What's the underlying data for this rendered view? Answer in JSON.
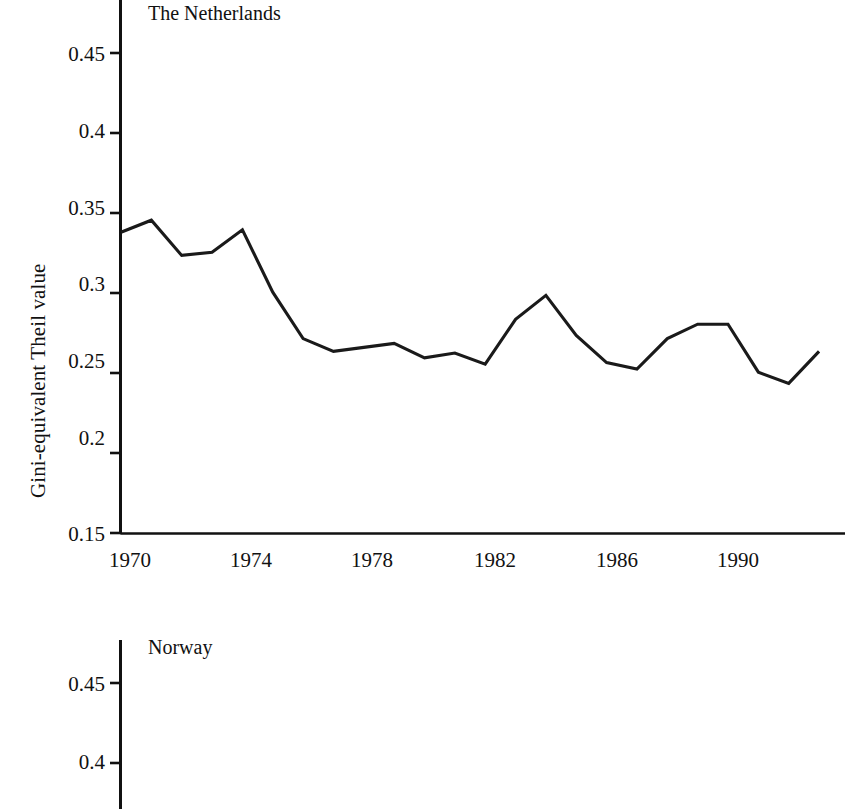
{
  "figure": {
    "ylabel": "Gini-equivalent Theil value"
  },
  "panels": [
    {
      "id": "netherlands",
      "title": "The Netherlands",
      "ylabel": "Gini-equivalent Theil value",
      "yticks": [
        "0.45",
        "0.4",
        "0.35",
        "0.3",
        "0.25",
        "0.2",
        "0.15"
      ],
      "xticks": [
        "1970",
        "1974",
        "1978",
        "1982",
        "1986",
        "1990"
      ]
    },
    {
      "id": "norway",
      "title": "Norway",
      "ylabel_partial": "ue",
      "yticks": [
        "0.45",
        "0.4"
      ],
      "xticks": []
    }
  ],
  "chart_data": [
    {
      "type": "line",
      "title": "The Netherlands",
      "xlabel": "",
      "ylabel": "Gini-equivalent Theil value",
      "xlim": [
        1970,
        1993.2
      ],
      "ylim": [
        0.15,
        0.47
      ],
      "xticks": [
        1970,
        1974,
        1978,
        1982,
        1986,
        1990
      ],
      "yticks": [
        0.15,
        0.2,
        0.25,
        0.3,
        0.35,
        0.4,
        0.45
      ],
      "grid": false,
      "legend": "none",
      "x": [
        1970,
        1971,
        1972,
        1973,
        1974,
        1975,
        1976,
        1977,
        1978,
        1979,
        1980,
        1981,
        1982,
        1983,
        1984,
        1985,
        1986,
        1987,
        1988,
        1989,
        1990,
        1991,
        1992,
        1993
      ],
      "series": [
        {
          "name": "The Netherlands",
          "values": [
            0.338,
            0.3455,
            0.3235,
            0.3255,
            0.3395,
            0.3005,
            0.2715,
            0.2635,
            0.266,
            0.2685,
            0.2595,
            0.2625,
            0.2555,
            0.2835,
            0.2985,
            0.2735,
            0.2565,
            0.2525,
            0.2715,
            0.2805,
            0.2805,
            0.2505,
            0.2435,
            0.2635
          ]
        }
      ]
    },
    {
      "type": "line",
      "title": "Norway",
      "xlabel": "",
      "ylabel": "Gini-equivalent Theil value",
      "ylim": [
        0.15,
        0.47
      ],
      "yticks": [
        0.4,
        0.45
      ],
      "grid": false,
      "legend": "none",
      "note": "panel cropped by image bottom edge; no data line visible",
      "x": [],
      "series": []
    }
  ]
}
